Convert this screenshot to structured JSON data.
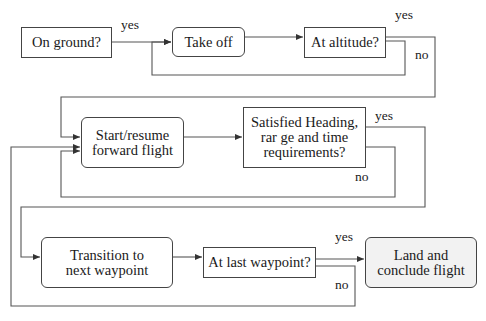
{
  "diagram": {
    "type": "flowchart",
    "colors": {
      "line": "#444444",
      "box_border": "#444444",
      "box_fill": "#ffffff",
      "terminal_fill": "#f2f2f2",
      "text": "#1a1a1a"
    },
    "nodes": {
      "on_ground": {
        "label": "On ground?",
        "shape": "rectangle"
      },
      "take_off": {
        "label": "Take off",
        "shape": "rounded"
      },
      "at_altitude": {
        "label": "At altitude?",
        "shape": "rectangle"
      },
      "forward_flight": {
        "label": "Start/resume forward flight",
        "shape": "rounded"
      },
      "satisfied": {
        "label": "Satisfied Heading, rar ge and time requirements?",
        "shape": "rectangle"
      },
      "transition": {
        "label": "Transition to next waypoint",
        "shape": "rounded"
      },
      "last_waypoint": {
        "label": "At last waypoint?",
        "shape": "rectangle"
      },
      "land": {
        "label": "Land and conclude flight",
        "shape": "rounded"
      }
    },
    "edge_labels": {
      "on_ground_yes": "yes",
      "at_altitude_yes": "yes",
      "at_altitude_no": "no",
      "satisfied_yes": "yes",
      "satisfied_no": "no",
      "last_waypoint_yes": "yes",
      "last_waypoint_no": "no"
    },
    "edges": [
      {
        "from": "on_ground",
        "to": "take_off",
        "label": "yes"
      },
      {
        "from": "take_off",
        "to": "at_altitude"
      },
      {
        "from": "at_altitude",
        "to": "take_off",
        "label": "no"
      },
      {
        "from": "at_altitude",
        "to": "forward_flight",
        "label": "yes"
      },
      {
        "from": "forward_flight",
        "to": "satisfied"
      },
      {
        "from": "satisfied",
        "to": "forward_flight",
        "label": "no"
      },
      {
        "from": "satisfied",
        "to": "transition",
        "label": "yes"
      },
      {
        "from": "transition",
        "to": "last_waypoint"
      },
      {
        "from": "last_waypoint",
        "to": "land",
        "label": "yes"
      },
      {
        "from": "last_waypoint",
        "to": "forward_flight",
        "label": "no"
      }
    ]
  }
}
